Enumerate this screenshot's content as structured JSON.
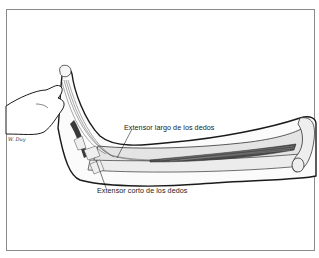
{
  "figure": {
    "labels": [
      {
        "id": "extensor-largo",
        "text": "Extensor largo de los dedos"
      },
      {
        "id": "extensor-corto",
        "text": "Extensor corto de los dedos"
      }
    ],
    "signature": "W. Duy"
  },
  "colors": {
    "frame": "#8a8a8a",
    "bone_fill": "#e4e4e4",
    "outline": "#1a1a1a",
    "muscle": "#4a4a4a"
  }
}
